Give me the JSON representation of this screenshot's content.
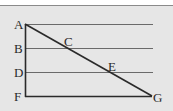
{
  "diagram": {
    "points": {
      "A": "A",
      "B": "B",
      "C": "C",
      "D": "D",
      "E": "E",
      "F": "F",
      "G": "G"
    },
    "segments": [
      {
        "name": "horizontal line through A",
        "from": "A",
        "to": "(right end)"
      },
      {
        "name": "horizontal line through B and C",
        "from": "B",
        "to": "(right end)"
      },
      {
        "name": "horizontal line through D and E",
        "from": "D",
        "to": "(right end)"
      },
      {
        "name": "segment FG",
        "from": "F",
        "to": "G"
      },
      {
        "name": "segment AF",
        "from": "A",
        "to": "F"
      },
      {
        "name": "segment AG",
        "from": "A",
        "to": "G"
      }
    ],
    "colors": {
      "background": "#e6e6e6",
      "line": "#2a2a2a",
      "thin_line": "#5a5a5a"
    }
  }
}
